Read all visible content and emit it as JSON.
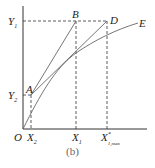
{
  "figure": {
    "caption": "(b)",
    "colors": {
      "axis": "#333333",
      "line": "#555555",
      "dashed": "#333333",
      "text": "#222222"
    },
    "axes": {
      "origin_label": "O",
      "y_ticks": [
        {
          "label": "Y",
          "sub": "1"
        },
        {
          "label": "Y",
          "sub": "2"
        }
      ],
      "x_ticks": [
        {
          "label": "X",
          "sub": "2"
        },
        {
          "label": "X",
          "sub": "1"
        },
        {
          "label": "X",
          "sup": "*",
          "sub": "1,max"
        }
      ]
    },
    "points": [
      {
        "label": "A"
      },
      {
        "label": "B"
      },
      {
        "label": "D"
      },
      {
        "label": "E"
      }
    ]
  }
}
